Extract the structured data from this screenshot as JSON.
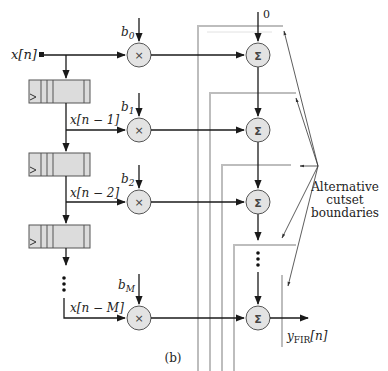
{
  "figure": {
    "caption": "(b)",
    "input_label": "x[n]",
    "output_label": {
      "main": "y",
      "sub": "FIR",
      "tail": "[n]"
    },
    "adder_initial_input": "0",
    "annotation": [
      "Alternative",
      "cutset",
      "boundaries"
    ],
    "taps": [
      {
        "coef": "b",
        "coef_sub": "0",
        "signal": "x[n]"
      },
      {
        "coef": "b",
        "coef_sub": "1",
        "signal": "x[n − 1]"
      },
      {
        "coef": "b",
        "coef_sub": "2",
        "signal": "x[n − 2]"
      },
      {
        "coef": "b",
        "coef_sub": "M",
        "signal": "x[n − M]"
      }
    ],
    "multiplier_symbol": "×",
    "adder_symbol": "Σ",
    "ellipsis": "⋮",
    "delay_register_count": 3,
    "cutset_boundary_count": 4,
    "colors": {
      "wire": "#1a1a1a",
      "cutset": "#bdbdbd",
      "node_fill": "#e3e3e3"
    }
  }
}
